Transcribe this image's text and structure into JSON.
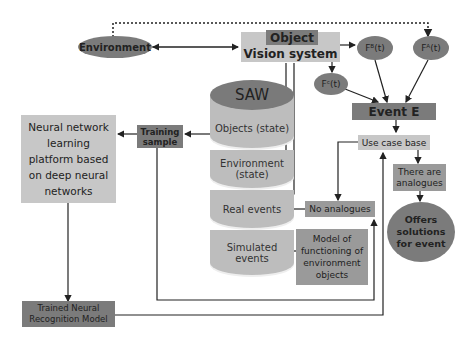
{
  "diagram": {
    "environment": "Environment",
    "object_title": "Object",
    "vision_system": "Vision system",
    "f_b": "Fᴮ(t)",
    "f_a": "Fᴬ(t)",
    "f_c": "Fᶜ(t)",
    "event_e": "Event E",
    "use_case_base": "Use case base",
    "there_are_analogues": "There are analogues",
    "offers_solutions": "Offers solutions for event",
    "no_analogues": "No analogues",
    "model_of_functioning": "Model of functioning of environment objects",
    "training_sample": "Training sample",
    "neural_platform": "Neural network learning platform based on deep neural networks",
    "trained_model": "Trained Neural Recognition Model",
    "saw": {
      "title": "SAW",
      "segments": [
        "Objects (state)",
        "Environment (state)",
        "Real events",
        "Simulated events"
      ]
    }
  },
  "colors": {
    "dark_gray": "#7b7b7b",
    "mid_gray": "#9a9a9a",
    "light_gray": "#c7c7c7",
    "line": "#222222"
  }
}
